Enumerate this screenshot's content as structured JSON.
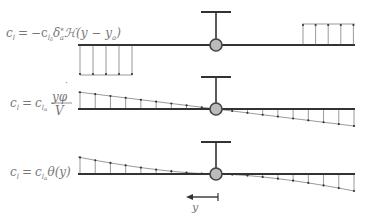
{
  "panels": [
    {
      "id": "aileron",
      "formula": {
        "lhs": "c",
        "lhs_sub": "l",
        "eq": "=",
        "rhs_a": "−c",
        "rhs_sub": "l",
        "rhs_subsub": "δ",
        "rhs_b": "δ",
        "rhs_b_sup": "*",
        "rhs_b_sub": "a",
        "rhs_c": "ℋ(y − y",
        "rhs_c_sub": "a",
        "rhs_d": ")"
      },
      "distribution": "step",
      "left_arrow_count": 5,
      "right_arrow_count": 5
    },
    {
      "id": "roll-rate",
      "formula": {
        "lhs": "c",
        "lhs_sub": "l",
        "eq": "=",
        "rhs_a": "c",
        "rhs_sub": "l",
        "rhs_subsub": "α",
        "numerator": "yφ",
        "numerator_dot": "˙",
        "denominator": "V"
      },
      "distribution": "linear",
      "arrow_count": 18
    },
    {
      "id": "twist",
      "formula": {
        "lhs": "c",
        "lhs_sub": "l",
        "eq": "=",
        "rhs_a": "c",
        "rhs_sub": "l",
        "rhs_subsub": "α",
        "rhs_b": "θ(y)"
      },
      "distribution": "cubic",
      "arrow_count": 18
    }
  ],
  "axis": {
    "label": "y",
    "direction": "left"
  },
  "colors": {
    "line": "#333333",
    "pivot_fill": "#bbbbbb",
    "pivot_stroke": "#444444",
    "arrow": "#555555",
    "formula": "#777777"
  }
}
